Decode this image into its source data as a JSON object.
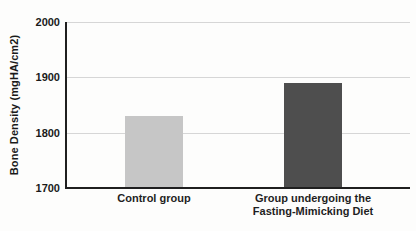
{
  "chart_data": {
    "type": "bar",
    "title": "",
    "categories": [
      "Control group",
      "Group undergoing the\nFasting-Mimicking Diet"
    ],
    "values": [
      1830,
      1890
    ],
    "bar_colors": [
      "#c6c6c6",
      "#4e4e4e"
    ],
    "xlabel": "",
    "ylabel": "Bone Density (mgHA/cm2)",
    "ylim": [
      1700,
      2000
    ],
    "yticks": [
      1700,
      1800,
      1900,
      2000
    ],
    "grid": true,
    "legend": false,
    "colors": {
      "axis": "#1f1f1f",
      "gridline": "#d6d6d6",
      "text": "#1a1a1a",
      "background": "#fdfdfc"
    }
  }
}
